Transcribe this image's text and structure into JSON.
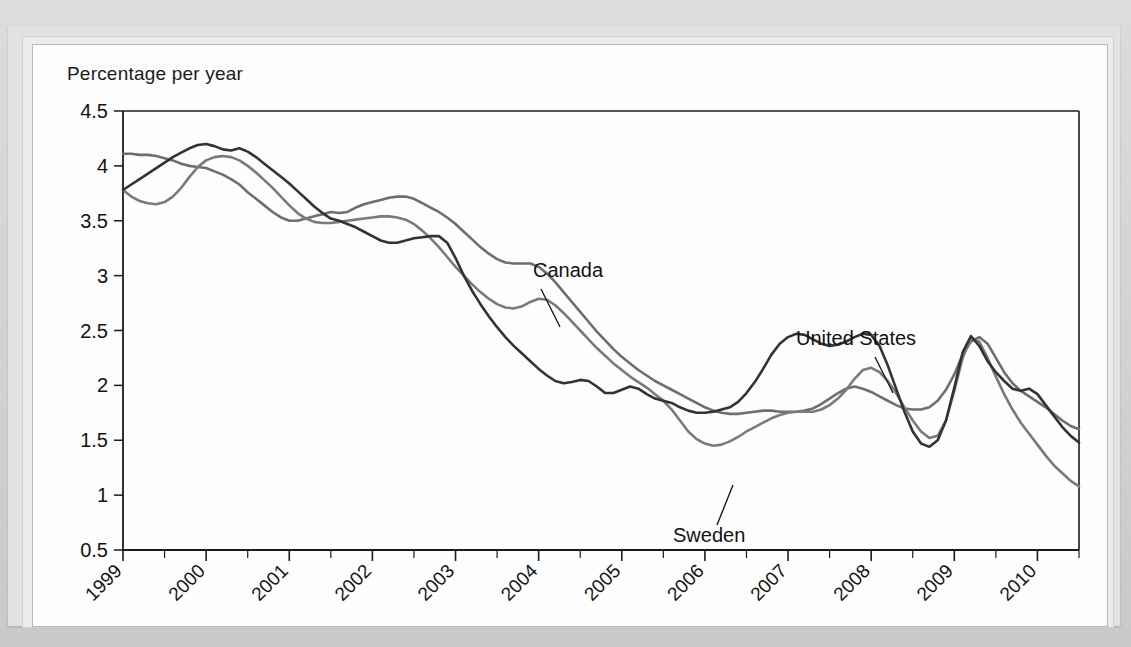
{
  "figure": {
    "y_axis_title": "Percentage per year"
  },
  "annotations": {
    "canada": "Canada",
    "sweden": "Sweden",
    "united_states": "United States"
  },
  "colors": {
    "canada_line": "#6e6e6e",
    "sweden_line": "#7a7a7a",
    "united_states_line": "#333333",
    "axis": "#1b1b1b",
    "panel_background": "#fdfdfd",
    "page_background": "#d9d9d9"
  },
  "chart_data": {
    "type": "line",
    "title": "",
    "subtitle": "",
    "xlabel": "",
    "ylabel": "Percentage per year",
    "xlim": [
      1999.0,
      2010.5
    ],
    "ylim": [
      0.5,
      4.5
    ],
    "yticks": [
      0.5,
      1,
      1.5,
      2,
      2.5,
      3,
      3.5,
      4,
      4.5
    ],
    "ytick_labels": [
      "0.5",
      "1",
      "1.5",
      "2",
      "2.5",
      "3",
      "3.5",
      "4",
      "4.5"
    ],
    "xticks": [
      1999,
      2000,
      2001,
      2002,
      2003,
      2004,
      2005,
      2006,
      2007,
      2008,
      2009,
      2010
    ],
    "xtick_labels": [
      "1999",
      "2000",
      "2001",
      "2002",
      "2003",
      "2004",
      "2005",
      "2006",
      "2007",
      "2008",
      "2009",
      "2010"
    ],
    "xtick_rotation_deg": -45,
    "minor_xtick_interval": 0.5,
    "grid": false,
    "legend": "inline-annotations",
    "x": [
      1999.0,
      1999.1,
      1999.2,
      1999.3,
      1999.4,
      1999.5,
      1999.6,
      1999.7,
      1999.8,
      1999.9,
      2000.0,
      2000.1,
      2000.2,
      2000.3,
      2000.4,
      2000.5,
      2000.6,
      2000.7,
      2000.8,
      2000.9,
      2001.0,
      2001.1,
      2001.2,
      2001.3,
      2001.4,
      2001.5,
      2001.6,
      2001.7,
      2001.8,
      2001.9,
      2002.0,
      2002.1,
      2002.2,
      2002.3,
      2002.4,
      2002.5,
      2002.6,
      2002.7,
      2002.8,
      2002.9,
      2003.0,
      2003.1,
      2003.2,
      2003.3,
      2003.4,
      2003.5,
      2003.6,
      2003.7,
      2003.8,
      2003.9,
      2004.0,
      2004.1,
      2004.2,
      2004.3,
      2004.4,
      2004.5,
      2004.6,
      2004.7,
      2004.8,
      2004.9,
      2005.0,
      2005.1,
      2005.2,
      2005.3,
      2005.4,
      2005.5,
      2005.6,
      2005.7,
      2005.8,
      2005.9,
      2006.0,
      2006.1,
      2006.2,
      2006.3,
      2006.4,
      2006.5,
      2006.6,
      2006.7,
      2006.8,
      2006.9,
      2007.0,
      2007.1,
      2007.2,
      2007.3,
      2007.4,
      2007.5,
      2007.6,
      2007.7,
      2007.8,
      2007.9,
      2008.0,
      2008.1,
      2008.2,
      2008.3,
      2008.4,
      2008.5,
      2008.6,
      2008.7,
      2008.8,
      2008.9,
      2009.0,
      2009.1,
      2009.2,
      2009.3,
      2009.4,
      2009.5,
      2009.6,
      2009.7,
      2009.8,
      2009.9,
      2010.0,
      2010.1,
      2010.2,
      2010.3,
      2010.4,
      2010.5
    ],
    "series": [
      {
        "name": "Canada",
        "color": "#6e6e6e",
        "values": [
          4.11,
          4.11,
          4.1,
          4.1,
          4.09,
          4.07,
          4.05,
          4.02,
          4.0,
          3.99,
          3.98,
          3.95,
          3.92,
          3.88,
          3.83,
          3.76,
          3.7,
          3.64,
          3.58,
          3.53,
          3.5,
          3.5,
          3.52,
          3.54,
          3.56,
          3.58,
          3.57,
          3.58,
          3.62,
          3.65,
          3.67,
          3.69,
          3.71,
          3.72,
          3.72,
          3.7,
          3.66,
          3.62,
          3.58,
          3.53,
          3.47,
          3.4,
          3.33,
          3.26,
          3.2,
          3.15,
          3.12,
          3.11,
          3.11,
          3.11,
          3.08,
          3.02,
          2.94,
          2.85,
          2.76,
          2.67,
          2.58,
          2.49,
          2.41,
          2.33,
          2.26,
          2.2,
          2.14,
          2.09,
          2.04,
          2.0,
          1.96,
          1.92,
          1.88,
          1.84,
          1.8,
          1.77,
          1.75,
          1.74,
          1.74,
          1.75,
          1.76,
          1.77,
          1.77,
          1.76,
          1.76,
          1.76,
          1.77,
          1.79,
          1.83,
          1.88,
          1.93,
          1.97,
          1.99,
          1.97,
          1.94,
          1.9,
          1.86,
          1.82,
          1.79,
          1.78,
          1.78,
          1.8,
          1.86,
          1.96,
          2.1,
          2.28,
          2.4,
          2.44,
          2.38,
          2.25,
          2.12,
          2.02,
          1.95,
          1.9,
          1.85,
          1.8,
          1.74,
          1.68,
          1.63,
          1.6
        ]
      },
      {
        "name": "Sweden",
        "color": "#7a7a7a",
        "values": [
          3.78,
          3.72,
          3.68,
          3.66,
          3.65,
          3.67,
          3.72,
          3.8,
          3.9,
          3.99,
          4.05,
          4.08,
          4.09,
          4.08,
          4.05,
          4.0,
          3.94,
          3.87,
          3.8,
          3.72,
          3.64,
          3.57,
          3.52,
          3.49,
          3.48,
          3.48,
          3.49,
          3.5,
          3.51,
          3.52,
          3.53,
          3.54,
          3.54,
          3.53,
          3.51,
          3.47,
          3.41,
          3.34,
          3.26,
          3.17,
          3.08,
          3.0,
          2.92,
          2.85,
          2.79,
          2.74,
          2.71,
          2.7,
          2.72,
          2.76,
          2.79,
          2.78,
          2.73,
          2.66,
          2.58,
          2.5,
          2.42,
          2.34,
          2.27,
          2.2,
          2.14,
          2.08,
          2.03,
          1.98,
          1.92,
          1.86,
          1.78,
          1.68,
          1.58,
          1.51,
          1.47,
          1.45,
          1.46,
          1.49,
          1.53,
          1.58,
          1.62,
          1.66,
          1.7,
          1.73,
          1.75,
          1.76,
          1.76,
          1.76,
          1.78,
          1.82,
          1.88,
          1.96,
          2.06,
          2.14,
          2.16,
          2.12,
          2.04,
          1.93,
          1.8,
          1.68,
          1.58,
          1.52,
          1.54,
          1.68,
          1.95,
          2.25,
          2.43,
          2.4,
          2.25,
          2.08,
          1.92,
          1.78,
          1.66,
          1.56,
          1.46,
          1.36,
          1.27,
          1.2,
          1.13,
          1.08
        ]
      },
      {
        "name": "United States",
        "color": "#333333",
        "values": [
          3.78,
          3.83,
          3.88,
          3.93,
          3.98,
          4.03,
          4.08,
          4.12,
          4.16,
          4.19,
          4.2,
          4.18,
          4.15,
          4.14,
          4.16,
          4.13,
          4.08,
          4.02,
          3.96,
          3.9,
          3.84,
          3.77,
          3.7,
          3.63,
          3.57,
          3.52,
          3.5,
          3.47,
          3.44,
          3.4,
          3.36,
          3.32,
          3.3,
          3.3,
          3.32,
          3.34,
          3.35,
          3.36,
          3.36,
          3.3,
          3.16,
          3.0,
          2.86,
          2.74,
          2.63,
          2.53,
          2.44,
          2.36,
          2.29,
          2.22,
          2.15,
          2.09,
          2.04,
          2.02,
          2.03,
          2.05,
          2.04,
          1.99,
          1.93,
          1.93,
          1.96,
          1.99,
          1.97,
          1.92,
          1.88,
          1.86,
          1.84,
          1.8,
          1.77,
          1.75,
          1.75,
          1.76,
          1.78,
          1.8,
          1.85,
          1.93,
          2.03,
          2.15,
          2.28,
          2.38,
          2.44,
          2.47,
          2.46,
          2.42,
          2.38,
          2.36,
          2.37,
          2.4,
          2.44,
          2.47,
          2.46,
          2.36,
          2.18,
          1.97,
          1.76,
          1.58,
          1.47,
          1.44,
          1.5,
          1.68,
          1.98,
          2.3,
          2.45,
          2.36,
          2.22,
          2.12,
          2.04,
          1.97,
          1.95,
          1.97,
          1.92,
          1.82,
          1.72,
          1.62,
          1.54,
          1.48
        ]
      }
    ],
    "callouts": [
      {
        "label": "Canada",
        "points_to_year": 2003.55,
        "points_to_value": 3.12
      },
      {
        "label": "Sweden",
        "points_to_year": 2005.75,
        "points_to_value": 1.46
      },
      {
        "label": "United States",
        "points_to_year": 2007.55,
        "points_to_value": 2.37
      }
    ]
  }
}
